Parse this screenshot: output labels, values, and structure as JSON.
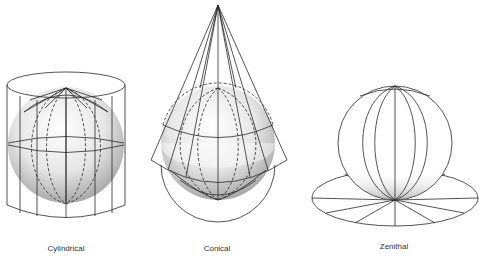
{
  "figure": {
    "type": "map projection surfaces",
    "panels": [
      {
        "id": "cylindrical",
        "label": "Cylindrical",
        "label_x": 66,
        "label_y": 244
      },
      {
        "id": "conical",
        "label": "Conical",
        "label_x": 217,
        "label_y": 244
      },
      {
        "id": "zenithal",
        "label": "Zenithal",
        "label_x": 394,
        "label_y": 242
      }
    ]
  },
  "colors": {
    "line": "#2a2a2a",
    "sphere_light": "#ffffff",
    "sphere_shade": "#a8a8a8",
    "background": "#ffffff"
  }
}
